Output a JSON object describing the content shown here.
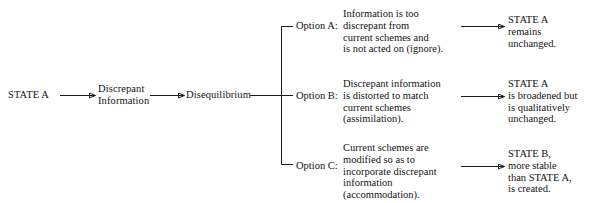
{
  "diagram": {
    "background_color": "#ffffff",
    "line_color": "#1a1a1a",
    "text_color": "#141414",
    "trunk": {
      "state_a": "STATE A",
      "discrepant_information": "Discrepant\nInformation",
      "disequilibrium": "Disequilibrium"
    },
    "options": [
      {
        "label": "Option A:",
        "description": "Information is too\ndiscrepant from\ncurrent schemes and\nis not acted on (ignore).",
        "outcome": "STATE A\nremains\nunchanged."
      },
      {
        "label": "Option B:",
        "description": "Discrepant information\nis distorted to match\ncurrent schemes\n(assimilation).",
        "outcome": "STATE A\nis broadened but\nis qualitatively\nunchanged."
      },
      {
        "label": "Option C:",
        "description": "Current schemes are\nmodified so as to\nincorporate discrepant\ninformation\n(accommodation).",
        "outcome": "STATE B,\nmore stable\nthan STATE A,\nis created."
      }
    ],
    "connectors": [
      {
        "name": "state-a-to-discrepant-information",
        "type": "arrow"
      },
      {
        "name": "discrepant-information-to-disequilibrium",
        "type": "arrow"
      },
      {
        "name": "disequilibrium-to-branch",
        "type": "line"
      },
      {
        "name": "branch-bracket",
        "type": "bracket"
      },
      {
        "name": "option-a-to-outcome-a",
        "type": "arrow"
      },
      {
        "name": "option-b-to-outcome-b",
        "type": "arrow"
      },
      {
        "name": "option-c-to-outcome-c",
        "type": "arrow"
      }
    ]
  }
}
